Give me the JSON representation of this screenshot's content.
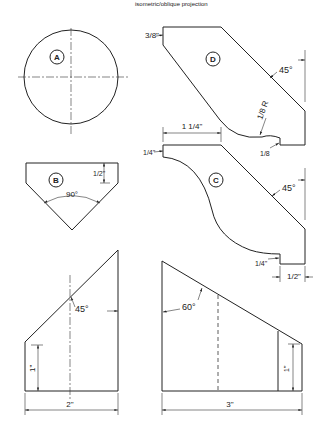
{
  "header": {
    "caption_fragment": "isometric/oblique projection"
  },
  "figures": {
    "A": {
      "label": "A",
      "shape": "circle"
    },
    "B": {
      "label": "B",
      "dims": {
        "depth": "1/2\"",
        "angle": "90°"
      }
    },
    "C": {
      "label": "C",
      "dims": {
        "top_step": "1/4\"",
        "width": "1 1/4\"",
        "angle": "45°",
        "bottom_step": "1/4\"",
        "base": "1/2\""
      }
    },
    "D": {
      "label": "D",
      "dims": {
        "top_chamfer": "3/8\"",
        "angle": "45°",
        "radius": "1/8 R",
        "step": "1/8"
      }
    },
    "E": {
      "dims": {
        "angle": "45°",
        "height": "1\"",
        "width": "2\""
      }
    },
    "F": {
      "dims": {
        "angle": "60°",
        "height": "1\"",
        "width": "3\""
      }
    }
  }
}
